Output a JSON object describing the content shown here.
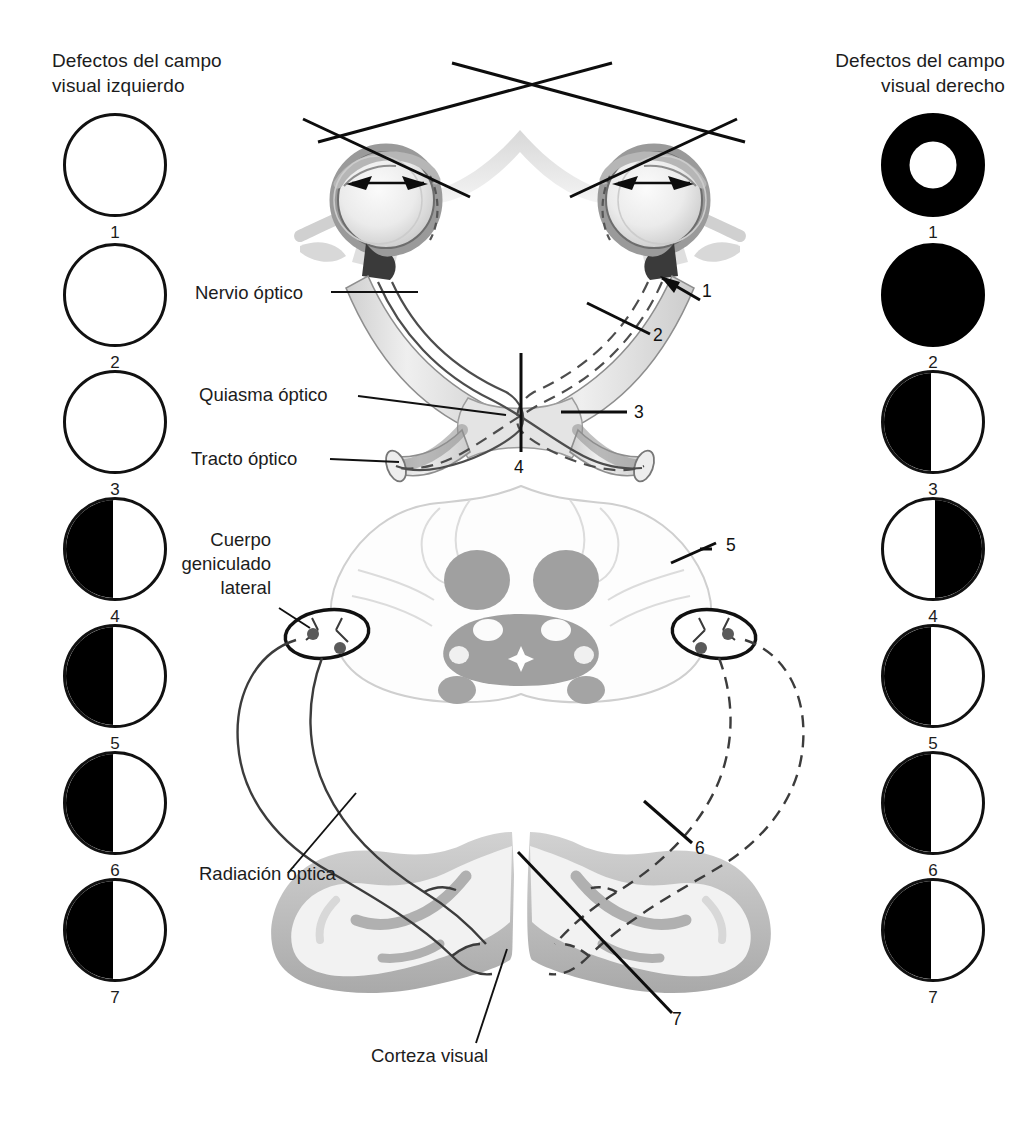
{
  "headers": {
    "left": "Defectos del campo\nvisual izquierdo",
    "right": "Defectos del campo\nvisual derecho"
  },
  "left_fields": [
    {
      "num": "1",
      "pattern": "empty"
    },
    {
      "num": "2",
      "pattern": "empty"
    },
    {
      "num": "3",
      "pattern": "empty"
    },
    {
      "num": "4",
      "pattern": "left-half"
    },
    {
      "num": "5",
      "pattern": "left-half"
    },
    {
      "num": "6",
      "pattern": "left-half"
    },
    {
      "num": "7",
      "pattern": "left-half"
    }
  ],
  "right_fields": [
    {
      "num": "1",
      "pattern": "ring"
    },
    {
      "num": "2",
      "pattern": "full"
    },
    {
      "num": "3",
      "pattern": "left-half"
    },
    {
      "num": "4",
      "pattern": "right-half"
    },
    {
      "num": "5",
      "pattern": "left-half"
    },
    {
      "num": "6",
      "pattern": "left-half"
    },
    {
      "num": "7",
      "pattern": "left-half"
    }
  ],
  "labels": {
    "optic_nerve": "Nervio óptico",
    "optic_chiasm": "Quiasma óptico",
    "optic_tract": "Tracto óptico",
    "lateral_geniculate": "Cuerpo\ngeniculado\nlateral",
    "optic_radiation": "Radiación óptica",
    "visual_cortex": "Corteza visual"
  },
  "lesion_markers": [
    {
      "num": "1"
    },
    {
      "num": "2"
    },
    {
      "num": "3"
    },
    {
      "num": "4"
    },
    {
      "num": "5"
    },
    {
      "num": "6"
    },
    {
      "num": "7"
    }
  ],
  "colors": {
    "ink": "#1c1c1c",
    "fill_black": "#000000",
    "page_background": "#ffffff",
    "tissue_light": "#e8e8e8",
    "tissue_mid": "#bdbdbd",
    "tissue_gray": "#a8a8a8",
    "cortex_gray": "#b5b5b5",
    "nucleus_gray": "#9e9e9e"
  }
}
